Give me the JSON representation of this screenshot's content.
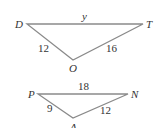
{
  "triangles": [
    {
      "name": "DOT",
      "vertices": {
        "top_left": "D",
        "top_right": "T",
        "bottom": "O"
      },
      "sides": {
        "top": "y",
        "left": "12",
        "right": "16"
      }
    },
    {
      "name": "PAN",
      "vertices": {
        "top_left": "P",
        "top_right": "N",
        "bottom": "A"
      },
      "sides": {
        "top": "18",
        "left": "9",
        "right": "12"
      }
    }
  ],
  "colors": {
    "line": "#8a8a8a",
    "text": "#333333"
  }
}
